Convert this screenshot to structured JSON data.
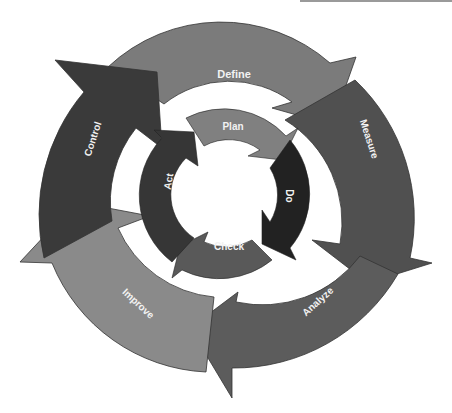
{
  "diagram": {
    "outer_cycle": {
      "name": "DMAIC",
      "steps": [
        {
          "label": "Define",
          "color": "#7b7b7b"
        },
        {
          "label": "Measure",
          "color": "#505050"
        },
        {
          "label": "Analyze",
          "color": "#5c5c5c"
        },
        {
          "label": "Improve",
          "color": "#8a8a8a"
        },
        {
          "label": "Control",
          "color": "#3a3a3a"
        }
      ]
    },
    "inner_cycle": {
      "name": "PDCA",
      "steps": [
        {
          "label": "Plan",
          "color": "#808080"
        },
        {
          "label": "Do",
          "color": "#222222"
        },
        {
          "label": "Check",
          "color": "#595959"
        },
        {
          "label": "Act",
          "color": "#363636"
        }
      ]
    }
  }
}
